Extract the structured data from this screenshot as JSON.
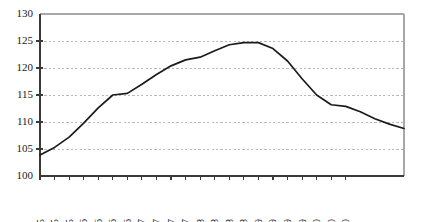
{
  "chart_data": {
    "type": "line",
    "title": "",
    "subtitle": "",
    "xlabel": "",
    "ylabel": "",
    "ylim": [
      100,
      130
    ],
    "yticks": [
      100,
      105,
      110,
      115,
      120,
      125,
      130
    ],
    "ytick_labels": [
      "100",
      "105",
      "110",
      "115",
      "120",
      "125",
      "130"
    ],
    "grid": true,
    "grid_axis": "y",
    "legend": false,
    "legend_position": "none",
    "line_color": "#1b1b1b",
    "grid_color": "#b9b9b9",
    "axis_color": "#3a3a3a",
    "categories": [
      "Jun-05",
      "Sep-05",
      "Dec-05",
      "Mar-06",
      "Jun-06",
      "Sep-06",
      "Dec-06",
      "Mar-07",
      "Jun-07",
      "Sep-07",
      "Dec-07",
      "Mar-08",
      "Jun-08",
      "Sep-08",
      "Dec-08",
      "Mar-09",
      "Jun-09",
      "Sep-09",
      "Dec-09",
      "Mar-10",
      "Jun-10",
      "Sep-10"
    ],
    "values": [
      103.9,
      105.3,
      107.2,
      109.8,
      112.6,
      115.0,
      115.3,
      117.0,
      118.8,
      120.4,
      121.5,
      122.0,
      123.2,
      124.3,
      124.7,
      124.7,
      123.6,
      121.3,
      118.0,
      115.0,
      113.2,
      112.9
    ],
    "values_tail": [
      111.9,
      110.6,
      109.6,
      108.8
    ],
    "series": [
      {
        "name": "index",
        "values": [
          103.9,
          105.3,
          107.2,
          109.8,
          112.6,
          115.0,
          115.3,
          117.0,
          118.8,
          120.4,
          121.5,
          122.0,
          123.2,
          124.3,
          124.7,
          124.7,
          123.6,
          121.3,
          118.0,
          115.0,
          113.2,
          112.9
        ]
      }
    ]
  }
}
